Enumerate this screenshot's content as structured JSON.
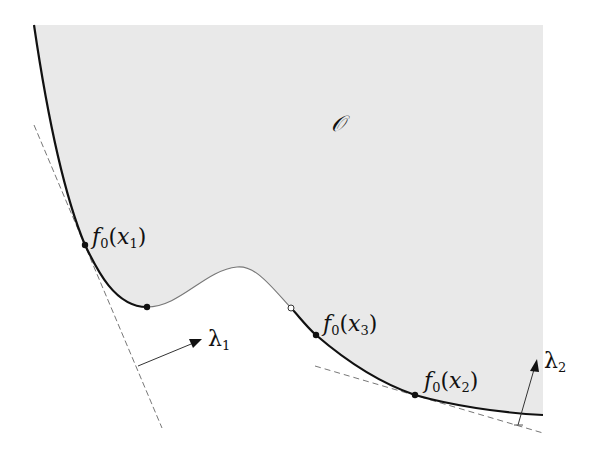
{
  "figure": {
    "region_label": "𝒪",
    "region_fill": "#e9e9e9",
    "curve_color": "#111111",
    "thin_curve_color": "#777777",
    "dashed_color": "#777777",
    "points": [
      {
        "name": "f0-x1",
        "fn": "f",
        "fn_sub": "0",
        "arg": "x",
        "arg_sub": "1",
        "x": 85,
        "y": 245,
        "filled": true
      },
      {
        "name": "bottom",
        "x": 147,
        "y": 307,
        "filled": true
      },
      {
        "name": "f0-x3",
        "fn": "f",
        "fn_sub": "0",
        "arg": "x",
        "arg_sub": "3",
        "x": 316,
        "y": 335,
        "filled": true
      },
      {
        "name": "f0-x2",
        "fn": "f",
        "fn_sub": "0",
        "arg": "x",
        "arg_sub": "2",
        "x": 415,
        "y": 395,
        "filled": true
      },
      {
        "name": "open",
        "x": 291,
        "y": 308,
        "filled": false
      }
    ],
    "lambda1": {
      "symbol": "λ",
      "sub": "1"
    },
    "lambda2": {
      "symbol": "λ",
      "sub": "2"
    }
  }
}
